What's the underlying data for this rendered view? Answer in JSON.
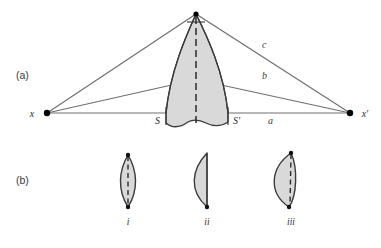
{
  "figure": {
    "width": 381,
    "height": 248,
    "background": "#ffffff"
  },
  "colors": {
    "shape_fill": "#d9d9d9",
    "shape_stroke": "#3a3a3a",
    "ray_stroke": "#6e6e6e",
    "dash_stroke": "#2b2b2b",
    "point_fill": "#000000",
    "text": "#2d2d2d"
  },
  "panel_a": {
    "label": "(a)",
    "points": [
      {
        "name": "x",
        "label": "x",
        "cx": 47,
        "cy": 113
      },
      {
        "name": "x-prime",
        "label": "x′",
        "cx": 350,
        "cy": 113
      },
      {
        "name": "apex",
        "label": "",
        "cx": 196,
        "cy": 14
      }
    ],
    "rays": [
      {
        "name": "ray-c",
        "label": "c",
        "label_x": 262,
        "label_y": 48
      },
      {
        "name": "ray-b",
        "label": "b",
        "label_x": 262,
        "label_y": 79
      },
      {
        "name": "ray-a",
        "label": "a",
        "label_x": 268,
        "label_y": 124
      }
    ],
    "section_marks": [
      {
        "name": "S",
        "label": "S",
        "x": 161,
        "y": 123
      },
      {
        "name": "S-prime",
        "label": "S′",
        "x": 230,
        "y": 123
      }
    ],
    "axis_label": "dashed-axis"
  },
  "panel_b": {
    "label": "(b)",
    "profiles": [
      {
        "name": "profile-i",
        "label": "i",
        "label_x": 128,
        "label_y": 224,
        "has_dashed_axis": true
      },
      {
        "name": "profile-ii",
        "label": "ii",
        "label_x": 207,
        "label_y": 224,
        "has_dashed_axis": false
      },
      {
        "name": "profile-iii",
        "label": "iii",
        "label_x": 291,
        "label_y": 224,
        "has_dashed_axis": true
      }
    ]
  }
}
